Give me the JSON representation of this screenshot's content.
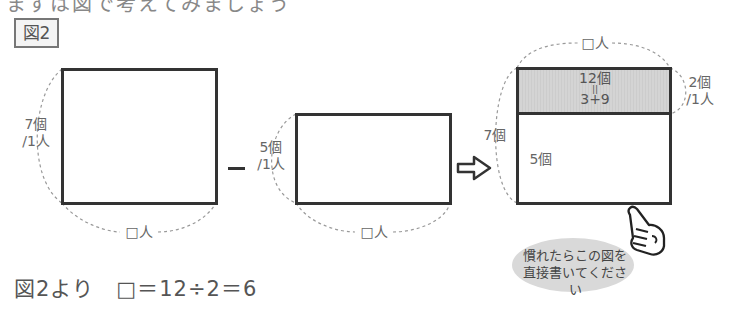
{
  "header": {
    "partial_title": "まずは図で考えてみましょう",
    "figure_label": "図2"
  },
  "left_box": {
    "side_label_line1": "7個",
    "side_label_line2": "/1人",
    "bottom_label": "□人"
  },
  "operator": "−",
  "middle_box": {
    "side_label_line1": "5個",
    "side_label_line2": "/1人",
    "bottom_label": "□人"
  },
  "right_box": {
    "top_label": "□人",
    "shaded_line1": "12個",
    "shaded_line2": "||",
    "shaded_line3": "3+9",
    "right_label_line1": "2個",
    "right_label_line2": "/1人",
    "outer_left_label": "7個",
    "inner_left_label": "5個"
  },
  "hint_bubble": {
    "line1": "慣れたらこの図を",
    "line2": "直接書いてください"
  },
  "answer": {
    "text": "図2より　□＝12÷2＝6"
  },
  "colors": {
    "line": "#333333",
    "shade": "#d4d4d4",
    "dash": "#999999",
    "bubble": "#d9d9d9"
  }
}
